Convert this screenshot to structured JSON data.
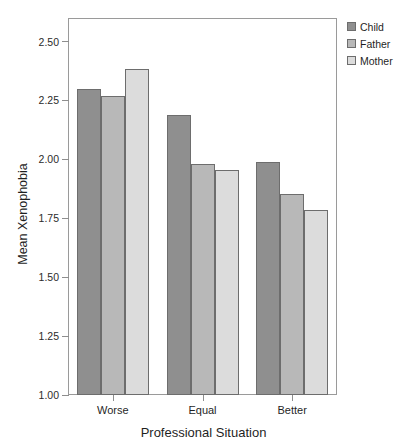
{
  "chart_data": {
    "type": "bar",
    "title": "",
    "subtitle": "",
    "xlabel": "Professional Situation",
    "ylabel": "Mean Xenophobia",
    "categories": [
      "Worse",
      "Equal",
      "Better"
    ],
    "series": [
      {
        "name": "Child",
        "color": "#8f8f8f",
        "values": [
          2.3,
          2.19,
          1.99
        ]
      },
      {
        "name": "Father",
        "color": "#b8b8b8",
        "values": [
          2.27,
          1.98,
          1.855
        ]
      },
      {
        "name": "Mother",
        "color": "#dcdcdc",
        "values": [
          2.385,
          1.955,
          1.785
        ]
      }
    ],
    "ylim": [
      1.0,
      2.6
    ],
    "yticks": [
      "1.00",
      "1.25",
      "1.50",
      "1.75",
      "2.00",
      "2.25",
      "2.50"
    ],
    "ytick_values": [
      1.0,
      1.25,
      1.5,
      1.75,
      2.0,
      2.25,
      2.5
    ],
    "grid": false,
    "legend_position": "right-top",
    "bar_border_color": "#6d6d6d",
    "axis_color": "#9a9a9a",
    "background": "#ffffff"
  },
  "legend": {
    "items": [
      {
        "label": "Child",
        "color": "#8f8f8f"
      },
      {
        "label": "Father",
        "color": "#b8b8b8"
      },
      {
        "label": "Mother",
        "color": "#dcdcdc"
      }
    ]
  }
}
